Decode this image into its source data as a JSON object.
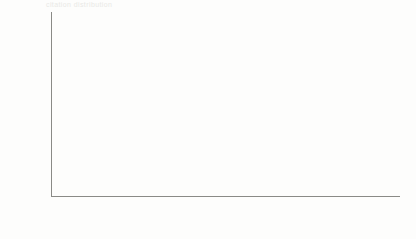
{
  "figure": {
    "ghost_top_text": "citation distribution",
    "background_color": "#fdfdfc",
    "axis_color": "#8a8a86"
  },
  "chart_data": {
    "type": "scatter",
    "title": "",
    "xlabel": "Citation",
    "ylabel": "Frequency",
    "xscale": "log",
    "yscale": "log",
    "grid": false,
    "legend": null,
    "xlim": [
      1,
      330
    ],
    "ylim": [
      1,
      120000
    ],
    "xticks": [
      1,
      2,
      5,
      10,
      20,
      50,
      100,
      200
    ],
    "xticklabels": [
      "1",
      "2",
      "5",
      "10",
      "20",
      "50",
      "100",
      "200"
    ],
    "yticks": [
      1,
      100,
      10000
    ],
    "yticklabels": [
      "1",
      "100",
      "10000"
    ],
    "marker": "open-circle",
    "marker_size": 5.2,
    "marker_color_light": "#9a9a96",
    "marker_color_mid": "#5a5a56",
    "marker_color_dark": "#181816",
    "x": [
      1,
      2,
      3,
      4,
      5,
      6,
      7,
      8,
      9,
      10,
      11,
      12,
      13,
      14,
      15,
      16,
      17,
      18,
      19,
      20,
      21,
      22,
      23,
      24,
      25,
      26,
      27,
      28,
      29,
      30,
      31,
      32,
      33,
      34,
      35,
      36,
      37,
      38,
      39,
      40,
      41,
      42,
      43,
      44,
      45,
      46,
      47,
      48,
      49,
      50,
      51,
      52,
      53,
      54,
      55,
      56,
      57,
      58,
      59,
      60,
      61,
      62,
      63,
      64,
      65,
      66,
      67,
      68,
      69,
      70,
      71,
      72,
      73,
      74,
      75,
      76,
      77,
      78,
      79,
      80,
      81,
      82,
      83,
      84,
      85,
      86,
      87,
      88,
      89,
      90,
      91,
      92,
      93,
      94,
      95,
      96,
      97,
      98,
      99,
      100,
      102,
      104,
      106,
      108,
      110,
      112,
      115,
      118,
      121,
      124,
      127,
      130,
      134,
      138,
      142,
      146,
      150,
      155,
      160,
      165,
      170,
      175,
      181,
      187,
      193,
      200,
      207,
      214,
      222,
      230,
      238,
      247,
      256,
      266,
      276,
      287,
      300,
      315
    ],
    "y": [
      64000,
      62000,
      60000,
      58000,
      55000,
      50000,
      46000,
      42000,
      39000,
      36000,
      33000,
      30000,
      27000,
      24000,
      21500,
      19000,
      17000,
      15000,
      13200,
      11800,
      10500,
      9400,
      8400,
      7500,
      6700,
      6000,
      5400,
      4800,
      4300,
      3850,
      3450,
      3100,
      2780,
      2500,
      2250,
      2020,
      1820,
      1640,
      1480,
      1330,
      1200,
      1080,
      980,
      885,
      800,
      725,
      655,
      595,
      540,
      490,
      445,
      405,
      368,
      335,
      305,
      278,
      253,
      231,
      211,
      193,
      176,
      161,
      148,
      135,
      124,
      114,
      105,
      96,
      88,
      81,
      75,
      69,
      63,
      58,
      54,
      50,
      46,
      42,
      39,
      36,
      33,
      31,
      28,
      26,
      24,
      22,
      21,
      19,
      18,
      16,
      15,
      14,
      13,
      12,
      11,
      11,
      10,
      9,
      9,
      8,
      8,
      7,
      7,
      6,
      6,
      6,
      5,
      5,
      5,
      4,
      4,
      4,
      4,
      3,
      3,
      3,
      3,
      3,
      3,
      2,
      2,
      2,
      2,
      2,
      2,
      2,
      2,
      2,
      1,
      1,
      1,
      1,
      1,
      1,
      1,
      1,
      1,
      1,
      1
    ]
  }
}
